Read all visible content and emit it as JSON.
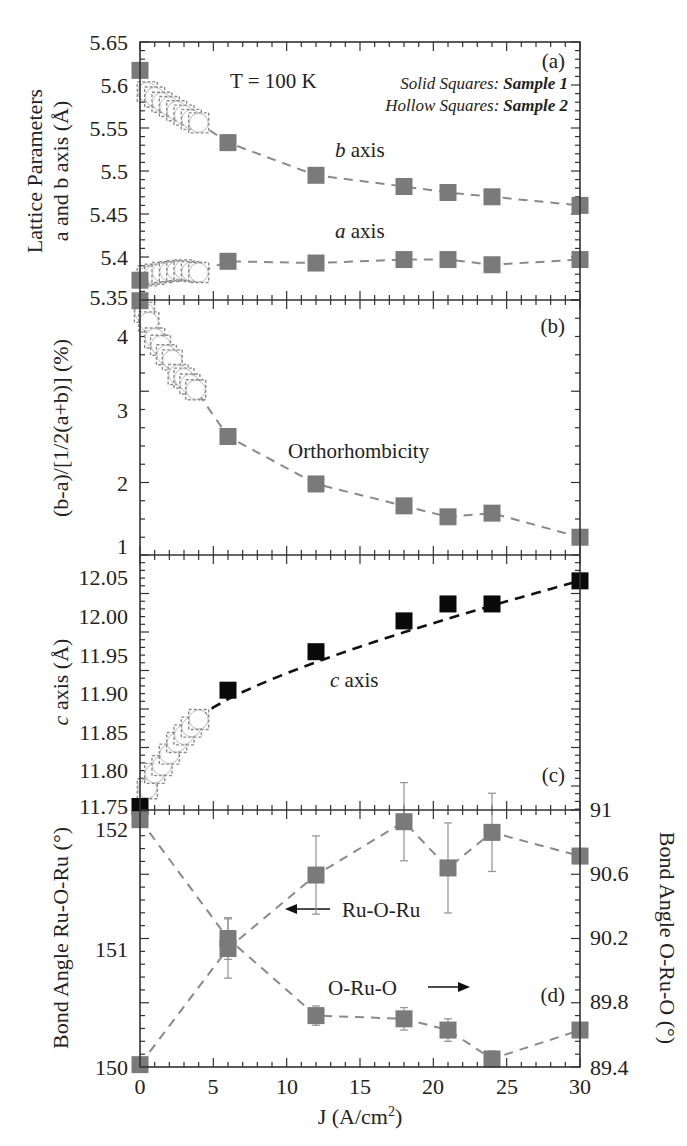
{
  "figure": {
    "temperature_label": "T = 100 K",
    "legend_solid_prefix": "Solid Squares:",
    "legend_solid_sample": "Sample 1",
    "legend_hollow_prefix": "Hollow Squares:",
    "legend_hollow_sample": "Sample 2",
    "xlabel": "J (A/cm",
    "xlabel_sup": "2",
    "xlabel_close": ")",
    "x_ticks": [
      "0",
      "5",
      "10",
      "15",
      "20",
      "25",
      "30"
    ]
  },
  "panels": {
    "a": {
      "tag": "(a)",
      "ylabel_line1": "Lattice Parameters",
      "ylabel_line2": "a and b axis (Å)",
      "y_ticks": [
        "5.65",
        "5.6",
        "5.55",
        "5.5",
        "5.45",
        "5.4",
        "5.35"
      ],
      "b_label": "b",
      "a_label": "a",
      "axis_word": " axis"
    },
    "b": {
      "tag": "(b)",
      "ylabel": "(b-a)/[1/2(a+b)] (%)",
      "y_ticks": [
        "4",
        "3",
        "2",
        "1"
      ],
      "curve_label": "Orthorhombicity"
    },
    "c": {
      "tag": "(c)",
      "ylabel": "c axis (Å)",
      "y_ticks": [
        "12.05",
        "12.00",
        "11.95",
        "11.90",
        "11.85",
        "11.80",
        "11.75"
      ],
      "curve_label_italic": "c",
      "curve_label_rest": " axis"
    },
    "d": {
      "tag": "(d)",
      "ylabel_left": "Bond Angle Ru-O-Ru (°)",
      "ylabel_right": "Bond Angle O-Ru-O (°)",
      "y_ticks_left": [
        "152",
        "151",
        "150"
      ],
      "y_ticks_right": [
        "91",
        "90.6",
        "90.2",
        "89.8",
        "89.4"
      ],
      "ruoru_label": "Ru-O-Ru",
      "oruo_label": "O-Ru-O"
    }
  },
  "colors": {
    "solid_marker": "#7a7a7a",
    "c_axis_marker": "#0a0a0a",
    "dash_line": "#8a8a8a",
    "frame": "#333333"
  },
  "chart_data": [
    {
      "type": "scatter",
      "panel": "a",
      "title": "",
      "xlabel": "J (A/cm2)",
      "ylabel": "Lattice Parameters a and b axis (Å)",
      "xlim": [
        0,
        30
      ],
      "ylim": [
        5.35,
        5.65
      ],
      "annotations": [
        "T = 100 K",
        "Solid Squares: Sample 1",
        "Hollow Squares: Sample 2",
        "(a)"
      ],
      "series": [
        {
          "name": "b axis (Sample 1)",
          "marker": "solid square",
          "x": [
            0,
            6,
            12,
            18,
            21,
            24,
            30
          ],
          "y": [
            5.617,
            5.533,
            5.495,
            5.482,
            5.475,
            5.47,
            5.46
          ]
        },
        {
          "name": "b axis (Sample 2)",
          "marker": "hollow",
          "x": [
            0.5,
            1.0,
            1.5,
            2.0,
            2.5,
            3.0,
            3.5,
            4.0
          ],
          "y": [
            5.592,
            5.586,
            5.58,
            5.575,
            5.57,
            5.565,
            5.56,
            5.556
          ]
        },
        {
          "name": "a axis (Sample 1)",
          "marker": "solid square",
          "x": [
            0,
            6,
            12,
            18,
            21,
            24,
            30
          ],
          "y": [
            5.373,
            5.395,
            5.393,
            5.397,
            5.397,
            5.391,
            5.397
          ]
        },
        {
          "name": "a axis (Sample 2)",
          "marker": "hollow",
          "x": [
            0.5,
            1.0,
            1.5,
            2.0,
            2.5,
            3.0,
            3.5,
            4.0
          ],
          "y": [
            5.378,
            5.38,
            5.382,
            5.383,
            5.384,
            5.385,
            5.383,
            5.382
          ]
        }
      ]
    },
    {
      "type": "scatter",
      "panel": "b",
      "xlabel": "J (A/cm2)",
      "ylabel": "(b-a)/[1/2(a+b)] (%)",
      "xlim": [
        0,
        30
      ],
      "ylim": [
        1,
        4.37
      ],
      "annotations": [
        "Orthorhombicity",
        "(b)"
      ],
      "series": [
        {
          "name": "Sample 1",
          "marker": "solid square",
          "x": [
            0,
            6,
            12,
            18,
            21,
            24,
            30
          ],
          "y": [
            4.36,
            2.5,
            1.85,
            1.55,
            1.4,
            1.45,
            1.12
          ]
        },
        {
          "name": "Sample 2",
          "marker": "hollow",
          "x": [
            0.3,
            0.6,
            1.0,
            1.4,
            1.8,
            2.2,
            2.6,
            3.0,
            3.4,
            3.8
          ],
          "y": [
            4.2,
            4.07,
            3.85,
            3.75,
            3.62,
            3.55,
            3.35,
            3.3,
            3.22,
            3.14
          ]
        }
      ]
    },
    {
      "type": "scatter",
      "panel": "c",
      "xlabel": "J (A/cm2)",
      "ylabel": "c axis (Å)",
      "xlim": [
        0,
        30
      ],
      "ylim": [
        11.75,
        12.06
      ],
      "annotations": [
        "c axis",
        "(c)"
      ],
      "series": [
        {
          "name": "Sample 1",
          "marker": "solid black square",
          "x": [
            0,
            6,
            12,
            18,
            21,
            24,
            30
          ],
          "y": [
            11.752,
            11.903,
            11.953,
            11.993,
            12.015,
            12.015,
            12.045
          ]
        },
        {
          "name": "Sample 2",
          "marker": "hollow",
          "x": [
            0.5,
            1.0,
            1.5,
            2.0,
            2.5,
            3.0,
            3.5,
            4.0
          ],
          "y": [
            11.775,
            11.795,
            11.805,
            11.82,
            11.835,
            11.845,
            11.855,
            11.865
          ]
        }
      ]
    },
    {
      "type": "scatter",
      "panel": "d",
      "xlabel": "J (A/cm2)",
      "ylabel": "Bond Angle Ru-O-Ru (°)",
      "ylabel_right": "Bond Angle O-Ru-O (°)",
      "xlim": [
        0,
        30
      ],
      "ylim": [
        150,
        152.15
      ],
      "ylim_right": [
        89.4,
        91
      ],
      "annotations": [
        "← Ru-O-Ru",
        "O-Ru-O →",
        "(d)"
      ],
      "series": [
        {
          "name": "Ru-O-Ru (left axis)",
          "x": [
            0,
            6,
            12,
            18,
            21,
            24,
            30
          ],
          "y": [
            150.02,
            151.0,
            151.62,
            152.07,
            151.68,
            151.98,
            151.78
          ],
          "yerr": [
            0,
            0.25,
            0.33,
            0.33,
            0.38,
            0.33,
            0
          ]
        },
        {
          "name": "O-Ru-O (right axis)",
          "x": [
            0,
            6,
            12,
            18,
            21,
            24,
            30
          ],
          "y": [
            90.94,
            90.2,
            89.72,
            89.7,
            89.63,
            89.45,
            89.63
          ],
          "yerr": [
            0,
            0.13,
            0.06,
            0.07,
            0.07,
            0.05,
            0
          ]
        }
      ]
    }
  ]
}
